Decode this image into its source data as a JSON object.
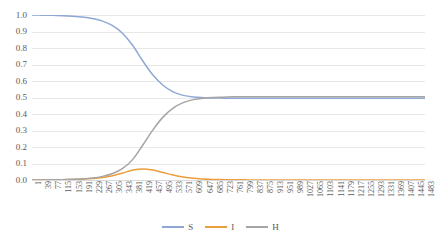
{
  "chart_data": {
    "type": "line",
    "title": "",
    "xlabel": "",
    "ylabel": "",
    "ylim": [
      0,
      1.0
    ],
    "xlim": [
      1,
      1483
    ],
    "grid": true,
    "legend_position": "bottom-center",
    "y_ticks": [
      "1.0",
      "0.9",
      "0.8",
      "0.7",
      "0.6",
      "0.5",
      "0.4",
      "0.3",
      "0.2",
      "0.1",
      "0.0"
    ],
    "x_ticks": [
      "1",
      "39",
      "77",
      "115",
      "153",
      "191",
      "229",
      "267",
      "305",
      "343",
      "381",
      "419",
      "457",
      "495",
      "533",
      "571",
      "609",
      "647",
      "685",
      "723",
      "761",
      "799",
      "837",
      "875",
      "913",
      "951",
      "989",
      "1027",
      "1065",
      "1103",
      "1141",
      "1179",
      "1217",
      "1255",
      "1293",
      "1331",
      "1369",
      "1407",
      "1445",
      "1483"
    ],
    "x_tick_step": 38,
    "x": [
      1,
      39,
      77,
      115,
      153,
      191,
      229,
      267,
      305,
      343,
      381,
      419,
      457,
      495,
      533,
      571,
      609,
      647,
      685,
      723,
      761,
      799,
      837,
      875,
      913,
      951,
      989,
      1027,
      1065,
      1103,
      1141,
      1179,
      1217,
      1255,
      1293,
      1331,
      1369,
      1407,
      1445,
      1483
    ],
    "series": [
      {
        "name": "S",
        "color": "#8FA8D4",
        "values": [
          1.0,
          0.999,
          0.998,
          0.996,
          0.993,
          0.988,
          0.979,
          0.963,
          0.935,
          0.888,
          0.815,
          0.721,
          0.636,
          0.574,
          0.534,
          0.513,
          0.503,
          0.499,
          0.497,
          0.496,
          0.495,
          0.495,
          0.495,
          0.495,
          0.495,
          0.495,
          0.495,
          0.495,
          0.495,
          0.495,
          0.495,
          0.495,
          0.495,
          0.495,
          0.495,
          0.495,
          0.495,
          0.495,
          0.495,
          0.495
        ]
      },
      {
        "name": "I",
        "color": "#ED9E3C",
        "values": [
          0.0,
          0.001,
          0.001,
          0.002,
          0.003,
          0.005,
          0.009,
          0.015,
          0.026,
          0.042,
          0.06,
          0.067,
          0.06,
          0.045,
          0.03,
          0.018,
          0.01,
          0.006,
          0.003,
          0.002,
          0.001,
          0.001,
          0.0,
          0.0,
          0.0,
          0.0,
          0.0,
          0.0,
          0.0,
          0.0,
          0.0,
          0.0,
          0.0,
          0.0,
          0.0,
          0.0,
          0.0,
          0.0,
          0.0,
          0.0
        ]
      },
      {
        "name": "H",
        "color": "#A5A5A5",
        "values": [
          0.0,
          0.0,
          0.001,
          0.002,
          0.004,
          0.007,
          0.012,
          0.022,
          0.039,
          0.07,
          0.125,
          0.212,
          0.304,
          0.381,
          0.436,
          0.469,
          0.487,
          0.496,
          0.5,
          0.502,
          0.504,
          0.505,
          0.505,
          0.505,
          0.505,
          0.505,
          0.505,
          0.505,
          0.505,
          0.505,
          0.505,
          0.505,
          0.505,
          0.505,
          0.505,
          0.505,
          0.505,
          0.505,
          0.505,
          0.505
        ]
      }
    ],
    "legend": [
      {
        "label": "S",
        "color": "#8FA8D4"
      },
      {
        "label": "I",
        "color": "#ED9E3C"
      },
      {
        "label": "H",
        "color": "#A5A5A5"
      }
    ]
  }
}
